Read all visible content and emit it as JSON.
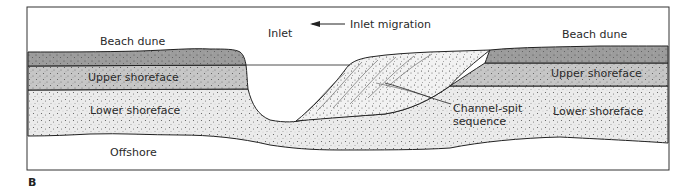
{
  "figure": {
    "panel_label": "B",
    "type": "geologic cross-section"
  },
  "labels": {
    "inlet": "Inlet",
    "inlet_migration": "Inlet migration",
    "beach_dune_left": "Beach dune",
    "beach_dune_right": "Beach dune",
    "upper_shoreface_left": "Upper shoreface",
    "upper_shoreface_right": "Upper shoreface",
    "lower_shoreface_left": "Lower shoreface",
    "lower_shoreface_right": "Lower shoreface",
    "offshore": "Offshore",
    "channel_spit_line1": "Channel-spit",
    "channel_spit_line2": "sequence"
  },
  "arrow": {
    "direction": "left",
    "meaning": "Inlet migration"
  },
  "layers": [
    {
      "name": "Beach dune",
      "fill": "#9a9a9a"
    },
    {
      "name": "Upper shoreface",
      "fill": "#c2c2c2"
    },
    {
      "name": "Lower shoreface",
      "fill": "#e6e6e6"
    },
    {
      "name": "Channel-spit sequence",
      "fill": "#efefef"
    },
    {
      "name": "Offshore",
      "fill": "#ffffff"
    }
  ]
}
